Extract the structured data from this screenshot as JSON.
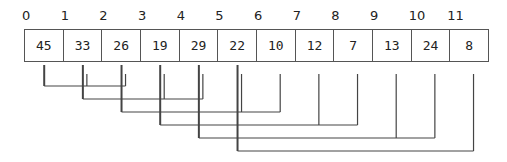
{
  "diagram": {
    "type": "array-as-binary-heap",
    "indices": [
      "0",
      "1",
      "2",
      "3",
      "4",
      "5",
      "6",
      "7",
      "8",
      "9",
      "10",
      "11"
    ],
    "values": [
      "45",
      "33",
      "26",
      "19",
      "29",
      "22",
      "10",
      "12",
      "7",
      "13",
      "24",
      "8"
    ],
    "edges": [
      {
        "parent": 0,
        "children": [
          1,
          2
        ]
      },
      {
        "parent": 1,
        "children": [
          3,
          4
        ]
      },
      {
        "parent": 2,
        "children": [
          5,
          6
        ]
      },
      {
        "parent": 3,
        "children": [
          7,
          8
        ]
      },
      {
        "parent": 4,
        "children": [
          9,
          10
        ]
      },
      {
        "parent": 5,
        "children": [
          11
        ]
      }
    ],
    "colors": {
      "line": "#444444",
      "border": "#555555",
      "text": "#222222"
    }
  }
}
